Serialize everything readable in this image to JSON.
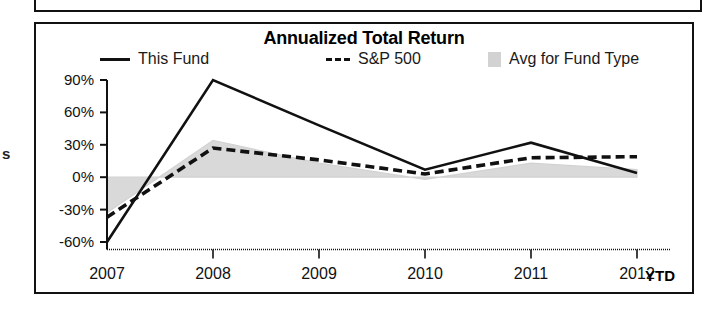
{
  "gutter": {
    "clipped_text": "s"
  },
  "chart_data": {
    "type": "line",
    "title": "Annualized Total Return",
    "xlabel": "",
    "ylabel": "",
    "grid": false,
    "legend_position": "top",
    "categories": [
      "2007",
      "2008",
      "2009",
      "2010",
      "2011",
      "2012 YTD"
    ],
    "x_tick_labels": [
      "2007",
      "2008",
      "2009",
      "2010",
      "2011",
      "2012"
    ],
    "x_suffix_label": "YTD",
    "y_tick_labels": [
      "90%",
      "60%",
      "30%",
      "0%",
      "-30%",
      "-60%"
    ],
    "y_tick_values": [
      90,
      60,
      30,
      0,
      -30,
      -60
    ],
    "ylim": [
      -70,
      95
    ],
    "series": [
      {
        "name": "This Fund",
        "style": "solid",
        "color": "#111111",
        "values": [
          -60,
          90,
          48,
          7,
          32,
          4
        ]
      },
      {
        "name": "S&P 500",
        "style": "dashed",
        "color": "#111111",
        "values": [
          -37,
          27,
          16,
          3,
          18,
          19
        ]
      },
      {
        "name": "Avg for Fund Type",
        "style": "filled-area",
        "color": "#d2d2d2",
        "values": [
          -33,
          34,
          13,
          -2,
          13,
          7
        ]
      }
    ]
  },
  "legend": {
    "items": [
      {
        "label": "This Fund",
        "marker": "solid-line-swatch"
      },
      {
        "label": "S&P 500",
        "marker": "dashed-line-swatch"
      },
      {
        "label": "Avg for Fund Type",
        "marker": "gray-box-swatch"
      }
    ]
  }
}
